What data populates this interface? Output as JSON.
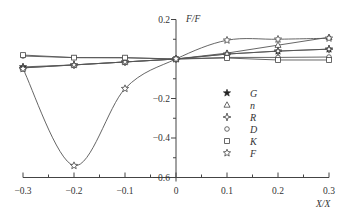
{
  "chart_data": {
    "type": "line",
    "title": "",
    "xlabel": "X/X",
    "ylabel": "F/F",
    "xlim": [
      -0.3,
      0.3
    ],
    "ylim": [
      -0.6,
      0.2
    ],
    "x_ticks": [
      -0.3,
      -0.2,
      -0.1,
      0,
      0.1,
      0.2,
      0.3
    ],
    "x_tick_labels": [
      "-0.3",
      "-0.2",
      "-0.1",
      "0",
      "0.1",
      "0.2",
      "0.3"
    ],
    "y_ticks": [
      0.2,
      -0.2,
      -0.4,
      -0.6
    ],
    "y_tick_labels": [
      "0.2",
      "-0.2",
      "-0.4",
      "-0.6"
    ],
    "y_minor_ticks": [
      0.1,
      -0.1,
      -0.3,
      -0.5
    ],
    "x_minor_ticks": [
      -0.25,
      -0.15,
      -0.05,
      0.05,
      0.15,
      0.25
    ],
    "grid": false,
    "legend_position": "center-right",
    "x": [
      -0.3,
      -0.2,
      -0.1,
      0,
      0.1,
      0.2,
      0.3
    ],
    "series": [
      {
        "name": "G",
        "marker": "filled-star",
        "values": [
          -0.04,
          -0.03,
          -0.015,
          0,
          0.025,
          0.04,
          0.05
        ]
      },
      {
        "name": "n",
        "marker": "triangle",
        "values": [
          -0.045,
          -0.03,
          -0.015,
          0,
          0.03,
          0.07,
          0.11
        ]
      },
      {
        "name": "R",
        "marker": "cross-star",
        "values": [
          -0.045,
          -0.03,
          -0.015,
          0,
          0.025,
          0.04,
          0.05
        ]
      },
      {
        "name": "D",
        "marker": "circle",
        "values": [
          0.015,
          0.007,
          0.006,
          0,
          0.008,
          0.008,
          0.01
        ]
      },
      {
        "name": "K",
        "marker": "square",
        "values": [
          0.02,
          0.007,
          0.007,
          0,
          0.005,
          -0.005,
          -0.005
        ]
      },
      {
        "name": "F",
        "marker": "open-star",
        "smooth": true,
        "values": [
          -0.05,
          -0.54,
          -0.15,
          0,
          0.095,
          0.1,
          0.105
        ]
      }
    ]
  }
}
